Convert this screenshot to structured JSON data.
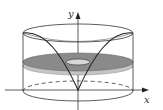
{
  "figure": {
    "axes": {
      "x_label": "x",
      "y_label": "y"
    },
    "colors": {
      "line": "#222222",
      "washer_fill": "#8a8a8a",
      "washer_edge": "#b5b5b5",
      "background": "#ffffff"
    }
  }
}
